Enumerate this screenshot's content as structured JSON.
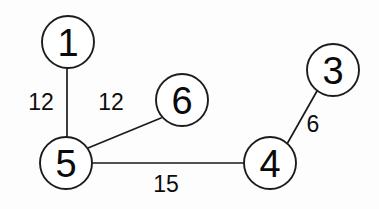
{
  "diagram": {
    "canvas": {
      "width": 379,
      "height": 209,
      "background": "#fdfdfd"
    },
    "style": {
      "node_fill": "#ffffff",
      "node_stroke": "#1c1c1c",
      "edge_stroke": "#1a1a1a",
      "text_color": "#0a0a0a"
    },
    "nodes": [
      {
        "id": "1",
        "label": "1",
        "cx": 68,
        "cy": 42,
        "r": 26
      },
      {
        "id": "6",
        "label": "6",
        "cx": 182,
        "cy": 100,
        "r": 26
      },
      {
        "id": "3",
        "label": "3",
        "cx": 333,
        "cy": 70,
        "r": 26
      },
      {
        "id": "5",
        "label": "5",
        "cx": 66,
        "cy": 163,
        "r": 26
      },
      {
        "id": "4",
        "label": "4",
        "cx": 270,
        "cy": 163,
        "r": 26
      }
    ],
    "edges": [
      {
        "id": "e-1-5",
        "from": "1",
        "to": "5",
        "weight": "12",
        "x1": 67,
        "y1": 68,
        "x2": 67,
        "y2": 137,
        "label_x": 41,
        "label_y": 102
      },
      {
        "id": "e-5-6",
        "from": "5",
        "to": "6",
        "weight": "12",
        "x1": 88,
        "y1": 148,
        "x2": 161,
        "y2": 118,
        "label_x": 111,
        "label_y": 102
      },
      {
        "id": "e-5-4",
        "from": "5",
        "to": "4",
        "weight": "15",
        "x1": 92,
        "y1": 163,
        "x2": 244,
        "y2": 163,
        "label_x": 166,
        "label_y": 184
      },
      {
        "id": "e-4-3",
        "from": "4",
        "to": "3",
        "weight": "6",
        "x1": 287,
        "y1": 144,
        "x2": 317,
        "y2": 91,
        "label_x": 313,
        "label_y": 124
      }
    ]
  }
}
